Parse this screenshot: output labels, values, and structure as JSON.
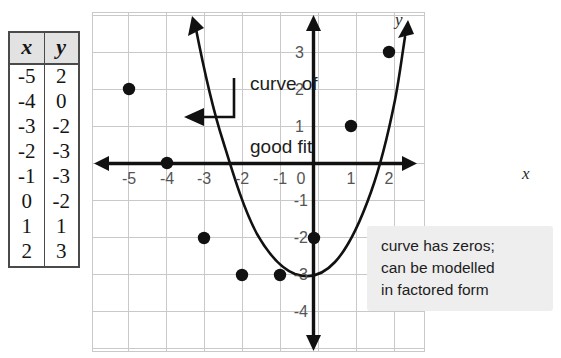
{
  "table": {
    "headers": [
      "x",
      "y"
    ],
    "rows": [
      [
        "-5",
        "2"
      ],
      [
        "-4",
        "0"
      ],
      [
        "-3",
        "-2"
      ],
      [
        "-2",
        "-3"
      ],
      [
        "-1",
        "-3"
      ],
      [
        "0",
        "-2"
      ],
      [
        "1",
        "1"
      ],
      [
        "2",
        "3"
      ]
    ]
  },
  "graph": {
    "axis_label_x": "x",
    "axis_label_y": "y",
    "x_ticks": [
      "-5",
      "-4",
      "-3",
      "-2",
      "-1",
      "0",
      "1",
      "2"
    ],
    "y_ticks": [
      "3",
      "2",
      "1",
      "-1",
      "-2",
      "-3",
      "-4"
    ],
    "curve_annotation_line1": "curve of",
    "curve_annotation_line2": "good fit",
    "grid_color": "#c9c9c9",
    "axis_color": "#111111",
    "curve_color": "#111111",
    "point_color": "#111111"
  },
  "note": {
    "line1": "curve has zeros;",
    "line2": "can be modelled",
    "line3": "in factored form",
    "background": "#eeeeee"
  },
  "chart_data": {
    "type": "scatter",
    "title": "",
    "xlabel": "x",
    "ylabel": "y",
    "x": [
      -5,
      -4,
      -3,
      -2,
      -1,
      0,
      1,
      2
    ],
    "values": [
      2,
      0,
      -2,
      -3,
      -3,
      -2,
      1,
      3
    ],
    "series": [
      {
        "name": "data points",
        "x": [
          -5,
          -4,
          -3,
          -2,
          -1,
          0,
          1,
          2
        ],
        "values": [
          2,
          0,
          -2,
          -3,
          -3,
          -2,
          1,
          3
        ]
      },
      {
        "name": "curve of good fit",
        "type": "line",
        "note": "upward-opening parabola through the plotted points, zeros near x = -4 and x = 0.5"
      }
    ],
    "xlim": [
      -5.8,
      2.9
    ],
    "ylim": [
      -4.6,
      3.9
    ],
    "grid": true,
    "legend": "none",
    "annotations": [
      "curve of good fit",
      "curve has zeros; can be modelled in factored form"
    ]
  }
}
